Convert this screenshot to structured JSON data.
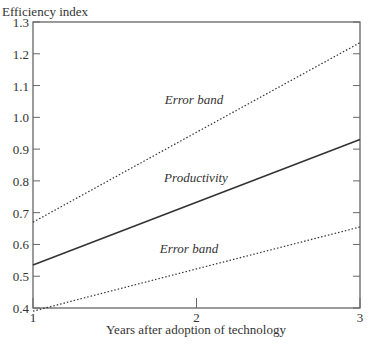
{
  "chart_data": {
    "type": "line",
    "title": "",
    "ylabel": "Efficiency index",
    "xlabel": "Years after adoption of technology",
    "x": [
      1,
      2,
      3
    ],
    "xlim": [
      1,
      3
    ],
    "ylim": [
      0.4,
      1.3
    ],
    "xticks": [
      "1",
      "2",
      "3"
    ],
    "yticks": [
      "0.4",
      "0.5",
      "0.6",
      "0.7",
      "0.8",
      "0.9",
      "1.0",
      "1.1",
      "1.2",
      "1.3"
    ],
    "grid": false,
    "legend": "none (inline labels)",
    "series": [
      {
        "name": "Error band (upper)",
        "style": "dotted",
        "values": [
          0.67,
          0.953,
          1.235
        ]
      },
      {
        "name": "Productivity",
        "style": "solid",
        "values": [
          0.535,
          0.733,
          0.93
        ]
      },
      {
        "name": "Error band (lower)",
        "style": "dotted",
        "values": [
          0.39,
          0.523,
          0.655
        ]
      }
    ],
    "annotations": [
      {
        "text": "Error band",
        "x": 1.95,
        "y": 0.95
      },
      {
        "text": "Productivity",
        "x": 1.95,
        "y": 0.71
      },
      {
        "text": "Error band",
        "x": 1.95,
        "y": 0.56
      }
    ]
  },
  "labels": {
    "ylabel": "Efficiency index",
    "xlabel": "Years after adoption of technology",
    "upper_band": "Error band",
    "productivity": "Productivity",
    "lower_band": "Error band"
  }
}
